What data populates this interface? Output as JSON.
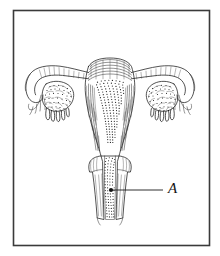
{
  "figure": {
    "kind": "anatomical-line-drawing",
    "background_color": "#ffffff",
    "ink_color": "#1a1a1a",
    "frame": {
      "name": "figure-border",
      "stroke_color": "#3a3a3a",
      "x": 13,
      "y": 10,
      "width": 197,
      "height": 236
    },
    "labels": [
      {
        "id": "A",
        "text": "A",
        "style": "italic-serif",
        "text_x": 170,
        "text_y": 190,
        "leader_from_x": 163,
        "leader_from_y": 190,
        "leader_to_x": 112,
        "leader_to_y": 190,
        "marker_dot_x": 111,
        "marker_dot_y": 190,
        "marker_dot_r": 2.1,
        "points_to": "vaginal-canal"
      }
    ],
    "structures": [
      {
        "name": "uterine-fundus",
        "texture": "concentric-wavy-hatching"
      },
      {
        "name": "uterine-body-myometrium",
        "texture": "vertical-striations"
      },
      {
        "name": "endometrial-cavity",
        "texture": "dense-stipple"
      },
      {
        "name": "fallopian-tube-left",
        "texture": "outline-with-hatching"
      },
      {
        "name": "fallopian-tube-right",
        "texture": "outline-with-hatching"
      },
      {
        "name": "ovary-left",
        "texture": "convoluted-stipple"
      },
      {
        "name": "ovary-right",
        "texture": "convoluted-stipple"
      },
      {
        "name": "fimbriae-left",
        "texture": "finger-projections"
      },
      {
        "name": "fimbriae-right",
        "texture": "finger-projections"
      },
      {
        "name": "cervix",
        "texture": "outline"
      },
      {
        "name": "vaginal-canal",
        "texture": "stipple"
      }
    ]
  }
}
